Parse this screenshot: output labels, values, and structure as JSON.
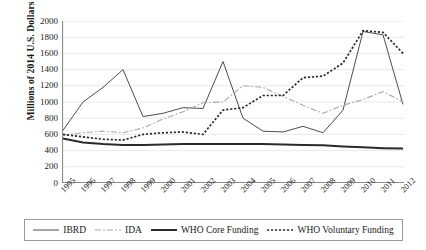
{
  "chart_data": {
    "type": "line",
    "title": "",
    "xlabel": "",
    "ylabel": "Millions of 2014 U.S. Dollars",
    "ylim": [
      0,
      2000
    ],
    "ytick_step": 200,
    "yticks": [
      "2000",
      "1800",
      "1600",
      "1400",
      "1200",
      "1000",
      "800",
      "600",
      "400",
      "200",
      "0"
    ],
    "grid": "horizontal",
    "legend_position": "bottom",
    "categories": [
      "1995",
      "1996",
      "1997",
      "1998",
      "1999",
      "2000",
      "2001",
      "2002",
      "2003",
      "2004",
      "2005",
      "2006",
      "2007",
      "2008",
      "2009",
      "2010",
      "2011",
      "2012"
    ],
    "series": [
      {
        "name": "IBRD",
        "style": "thin-solid",
        "color": "#4d4d4d",
        "values": [
          650,
          1000,
          1180,
          1400,
          820,
          860,
          930,
          920,
          1500,
          800,
          640,
          630,
          700,
          620,
          900,
          1870,
          1830,
          970
        ]
      },
      {
        "name": "IDA",
        "style": "dash-dot",
        "color": "#a8a8a8",
        "values": [
          590,
          620,
          640,
          620,
          680,
          790,
          880,
          990,
          1000,
          1200,
          1180,
          1070,
          960,
          860,
          960,
          1030,
          1130,
          1000
        ]
      },
      {
        "name": "WHO Core Funding",
        "style": "thick-solid",
        "color": "#2b2b2b",
        "values": [
          550,
          500,
          480,
          470,
          470,
          475,
          480,
          480,
          480,
          480,
          480,
          475,
          470,
          465,
          450,
          440,
          430,
          425
        ]
      },
      {
        "name": "WHO Voluntary Funding",
        "style": "dotted",
        "color": "#2b2b2b",
        "values": [
          600,
          570,
          540,
          530,
          600,
          620,
          630,
          600,
          900,
          930,
          1080,
          1080,
          1300,
          1320,
          1480,
          1880,
          1860,
          1600
        ]
      }
    ]
  },
  "legend": {
    "items": [
      {
        "label": "IBRD",
        "style": "thin-solid"
      },
      {
        "label": "IDA",
        "style": "dash-dot"
      },
      {
        "label": "WHO Core Funding",
        "style": "thick-solid"
      },
      {
        "label": "WHO Voluntary Funding",
        "style": "dotted"
      }
    ]
  }
}
